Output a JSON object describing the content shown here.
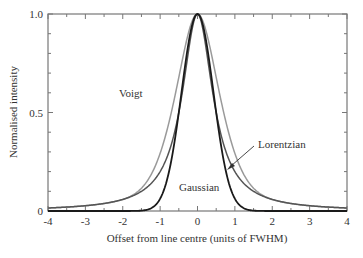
{
  "chart_data": {
    "type": "line",
    "title": "",
    "xlabel": "Offset from line centre (units of FWHM)",
    "ylabel": "Normalised intensity",
    "xlim": [
      -4,
      4
    ],
    "ylim": [
      0,
      1.0
    ],
    "x_ticks": [
      -4,
      -3,
      -2,
      -1,
      0,
      1,
      2,
      3,
      4
    ],
    "x_tick_labels": [
      "-4",
      "-3",
      "-2",
      "-1",
      "0",
      "1",
      "2",
      "3",
      "4"
    ],
    "y_ticks": [
      0,
      0.5,
      1.0
    ],
    "y_tick_labels": [
      "0",
      "0.5",
      "1.0"
    ],
    "grid": false,
    "legend": "none (inline annotations)",
    "series": [
      {
        "name": "Gaussian",
        "color": "#1a1a1a",
        "function": "gaussian",
        "fwhm": 1.0,
        "x": [
          -4,
          -1.5,
          -1,
          -0.75,
          -0.5,
          -0.25,
          0,
          0.25,
          0.5,
          0.75,
          1,
          1.5,
          4
        ],
        "values": [
          0,
          0.002,
          0.06,
          0.21,
          0.5,
          0.84,
          1.0,
          0.84,
          0.5,
          0.21,
          0.06,
          0.002,
          0
        ]
      },
      {
        "name": "Lorentzian",
        "color": "#555555",
        "function": "lorentzian",
        "fwhm": 1.0,
        "x": [
          -4,
          -3,
          -2,
          -1,
          -0.5,
          0,
          0.5,
          1,
          2,
          3,
          4
        ],
        "values": [
          0.015,
          0.027,
          0.059,
          0.2,
          0.5,
          1.0,
          0.5,
          0.2,
          0.059,
          0.027,
          0.015
        ]
      },
      {
        "name": "Voigt",
        "color": "#9a9a9a",
        "function": "voigt-like",
        "fwhm": 1.4,
        "x": [
          -4,
          -3,
          -2,
          -1,
          -0.5,
          0,
          0.5,
          1,
          2,
          3,
          4
        ],
        "values": [
          0.03,
          0.052,
          0.11,
          0.34,
          0.66,
          1.0,
          0.66,
          0.34,
          0.11,
          0.052,
          0.03
        ]
      }
    ],
    "annotations": [
      {
        "text": "Voigt",
        "x": -0.85,
        "y": 0.62
      },
      {
        "text": "Lorentzian",
        "x": 1.6,
        "y": 0.42,
        "arrow_to": [
          0.75,
          0.22
        ]
      },
      {
        "text": "Gaussian",
        "x": 0,
        "y": 0.14
      }
    ]
  }
}
